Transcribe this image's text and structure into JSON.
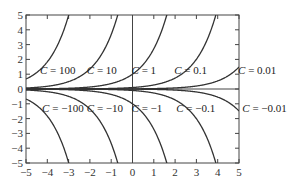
{
  "chart_data": {
    "type": "line",
    "title": "",
    "xlabel": "",
    "ylabel": "",
    "function": "y = C e^x",
    "xlim": [
      -5,
      5
    ],
    "ylim": [
      -5,
      5
    ],
    "grid": false,
    "x_ticks": [
      "−5",
      "−4",
      "−3",
      "−2",
      "−1",
      "0",
      "1",
      "2",
      "3",
      "4",
      "5"
    ],
    "y_ticks": [
      "5",
      "4",
      "3",
      "2",
      "1",
      "0",
      "−1",
      "−2",
      "−3",
      "−4",
      "−5"
    ],
    "series": [
      {
        "name": "C = 100",
        "C": 100
      },
      {
        "name": "C = 10",
        "C": 10
      },
      {
        "name": "C = 1",
        "C": 1
      },
      {
        "name": "C = 0.1",
        "C": 0.1
      },
      {
        "name": "C = 0.01",
        "C": 0.01
      },
      {
        "name": "C = −100",
        "C": -100
      },
      {
        "name": "C = −10",
        "C": -10
      },
      {
        "name": "C = −1",
        "C": -1
      },
      {
        "name": "C = −0.1",
        "C": -0.1
      },
      {
        "name": "C = −0.01",
        "C": -0.01
      }
    ],
    "annotations": [
      {
        "text": "C = 100",
        "x": -3.5,
        "y": 1.3
      },
      {
        "text": "C = 10",
        "x": -1.3,
        "y": 1.3
      },
      {
        "text": "C = 1",
        "x": 0.8,
        "y": 1.3
      },
      {
        "text": "C = 0.1",
        "x": 2.8,
        "y": 1.3
      },
      {
        "text": "C = 0.01",
        "x": 5.8,
        "y": 1.3
      },
      {
        "text": "C = −100",
        "x": -3.4,
        "y": -1.3
      },
      {
        "text": "C = −10",
        "x": -1.3,
        "y": -1.3
      },
      {
        "text": "C = −1",
        "x": 0.8,
        "y": -1.3
      },
      {
        "text": "C = −0.1",
        "x": 2.9,
        "y": -1.3
      },
      {
        "text": "C = −0.01",
        "x": 6.0,
        "y": -1.3
      }
    ]
  }
}
